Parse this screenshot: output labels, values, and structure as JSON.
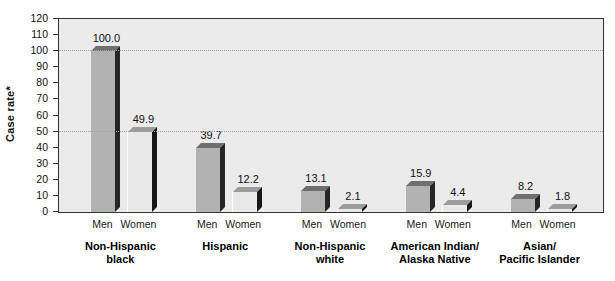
{
  "chart_data": {
    "type": "bar",
    "title": "",
    "ylabel": "Case rate*",
    "ymin": 0,
    "ymax": 120,
    "ytick_step": 10,
    "ytick_labels": [
      "0",
      "10",
      "20",
      "30",
      "40",
      "50",
      "60",
      "70",
      "80",
      "90",
      "100",
      "110",
      "120"
    ],
    "gridlines": [
      50,
      100
    ],
    "grid_style": "dotted",
    "legend": "none",
    "categories": [
      [
        "Non-Hispanic",
        "black"
      ],
      [
        "Hispanic"
      ],
      [
        "Non-Hispanic",
        "white"
      ],
      [
        "American Indian/",
        "Alaska Native"
      ],
      [
        "Asian/",
        "Pacific Islander"
      ]
    ],
    "sex_labels": [
      "Men",
      "Women"
    ],
    "series": [
      {
        "name": "Men",
        "values": [
          100.0,
          39.7,
          13.1,
          15.9,
          8.2
        ]
      },
      {
        "name": "Women",
        "values": [
          49.9,
          12.2,
          2.1,
          4.4,
          1.8
        ]
      }
    ],
    "value_labels": [
      [
        "100.0",
        "49.9"
      ],
      [
        "39.7",
        "12.2"
      ],
      [
        "13.1",
        "2.1"
      ],
      [
        "15.9",
        "4.4"
      ],
      [
        "8.2",
        "1.8"
      ]
    ]
  },
  "colors": {
    "background": "#ffffff",
    "plot_bg": "#ebebeb",
    "axis": "#333333",
    "grid": "#a3a3a3",
    "text": "#111111",
    "men_front": "#b2b2b2",
    "men_top": "#6f6f6f",
    "men_side": "#262626",
    "women_front": "#e9e9e9",
    "women_top": "#9c9c9c",
    "women_side": "#161616"
  }
}
